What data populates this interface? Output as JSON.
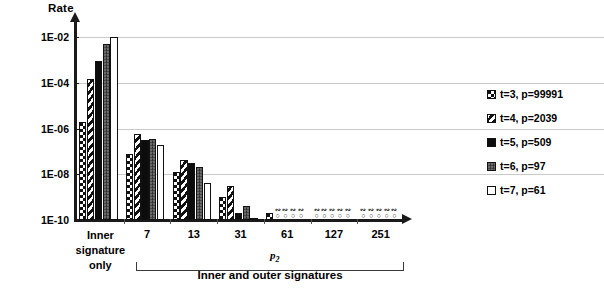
{
  "chart_data": {
    "type": "bar",
    "title": "",
    "ylabel": "Rate",
    "xlabel": "p2",
    "grid": true,
    "legend_position": "right",
    "y_scale": "log",
    "ylim": [
      1e-10,
      0.01
    ],
    "y_ticks": [
      "1E-02",
      "1E-04",
      "1E-06",
      "1E-08",
      "1E-10"
    ],
    "y_tick_values": [
      0.01,
      0.0001,
      1e-06,
      1e-08,
      1e-10
    ],
    "categories": [
      "Inner signature only",
      "7",
      "13",
      "31",
      "61",
      "127",
      "251"
    ],
    "category_labels": [
      [
        "Inner",
        "signature",
        "only"
      ],
      [
        "7"
      ],
      [
        "13"
      ],
      [
        "31"
      ],
      [
        "61"
      ],
      [
        "127"
      ],
      [
        "251"
      ]
    ],
    "group_caption": "Inner and outer signatures",
    "x_axis_symbol": "p",
    "x_axis_subscript": "2",
    "series": [
      {
        "name": "t=3, p=99991",
        "key": "t3",
        "pattern": "checker",
        "values": [
          2e-06,
          8e-08,
          1.2e-08,
          1e-09,
          2e-10,
          0,
          0
        ]
      },
      {
        "name": "t=4, p=2039",
        "key": "t4",
        "pattern": "diagonal-hatch",
        "values": [
          0.00014,
          6e-07,
          4e-08,
          3e-09,
          0,
          0,
          0
        ]
      },
      {
        "name": "t=5, p=509",
        "key": "t5",
        "pattern": "solid-black",
        "values": [
          0.0009,
          3e-07,
          3e-08,
          2e-10,
          0,
          0,
          0
        ]
      },
      {
        "name": "t=6, p=97",
        "key": "t6",
        "pattern": "dark-grey",
        "values": [
          0.005,
          3.5e-07,
          2e-08,
          4e-10,
          0,
          0,
          0
        ]
      },
      {
        "name": "t=7, p=61",
        "key": "t7",
        "pattern": "white-outline",
        "values": [
          0.01,
          2e-07,
          4e-09,
          1e-10,
          0,
          0,
          0
        ]
      }
    ]
  },
  "legend": {
    "items": [
      {
        "label": "t=3, p=99991",
        "key": "t3"
      },
      {
        "label": "t=4, p=2039",
        "key": "t4"
      },
      {
        "label": "t=5, p=509",
        "key": "t5"
      },
      {
        "label": "t=6, p=97",
        "key": "t6"
      },
      {
        "label": "t=7, p=61",
        "key": "t7"
      }
    ]
  }
}
